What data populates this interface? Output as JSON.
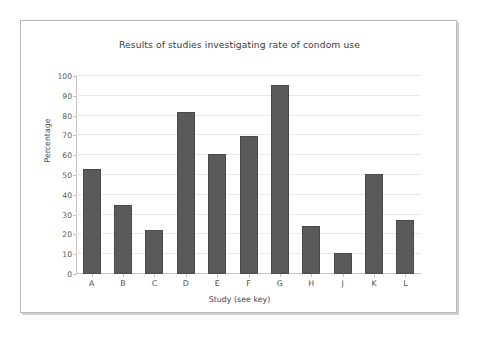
{
  "figure": {
    "background_color": "#ffffff",
    "frame_border_color": "#b9b9b9",
    "bar_color": "#5a5a5a",
    "gridline_color": "#e9e9e9",
    "axis_color": "#c4c4c4"
  },
  "chart_data": {
    "type": "bar",
    "title": "Results of studies investigating rate of condom use",
    "xlabel": "Study (see key)",
    "ylabel": "Percentage",
    "categories": [
      "A",
      "B",
      "C",
      "D",
      "E",
      "F",
      "G",
      "H",
      "J",
      "K",
      "L"
    ],
    "values": [
      53,
      35,
      22,
      82,
      60.5,
      69.5,
      95.5,
      24.5,
      10.5,
      50.5,
      27.5
    ],
    "ylim": [
      0,
      100
    ],
    "yticks": [
      0,
      10,
      20,
      30,
      40,
      50,
      60,
      70,
      80,
      90,
      100
    ],
    "ytick_labels": [
      "0",
      "10",
      "20",
      "30",
      "40",
      "50",
      "60",
      "70",
      "80",
      "90",
      "100"
    ],
    "grid": "horizontal",
    "legend": "none",
    "series": [
      {
        "name": "Percentage",
        "values": [
          53,
          35,
          22,
          82,
          60.5,
          69.5,
          95.5,
          24.5,
          10.5,
          50.5,
          27.5
        ]
      }
    ]
  }
}
